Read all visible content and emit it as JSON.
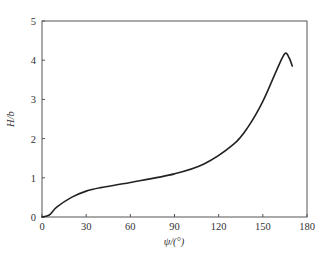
{
  "chart_data": {
    "type": "line",
    "title": "",
    "xlabel": "ψ/(°)",
    "ylabel": "H/b",
    "xlim": [
      0,
      180
    ],
    "ylim": [
      0,
      5
    ],
    "xticks": [
      0,
      30,
      60,
      90,
      120,
      150,
      180
    ],
    "yticks": [
      0,
      1,
      2,
      3,
      4,
      5
    ],
    "grid": false,
    "legend": null,
    "series": [
      {
        "name": "H/b",
        "color": "#222222",
        "x": [
          0,
          5,
          10,
          20,
          30,
          40,
          60,
          90,
          110,
          130,
          140,
          150,
          160,
          165,
          168,
          170
        ],
        "y": [
          0,
          0.05,
          0.25,
          0.5,
          0.66,
          0.75,
          0.88,
          1.1,
          1.35,
          1.85,
          2.3,
          2.95,
          3.8,
          4.17,
          4.05,
          3.85
        ]
      }
    ]
  },
  "axes": {
    "x_label": "ψ/(°)",
    "y_label": "H/b",
    "x_tick_labels": [
      "0",
      "30",
      "60",
      "90",
      "120",
      "150",
      "180"
    ],
    "y_tick_labels": [
      "0",
      "1",
      "2",
      "3",
      "4",
      "5"
    ]
  }
}
